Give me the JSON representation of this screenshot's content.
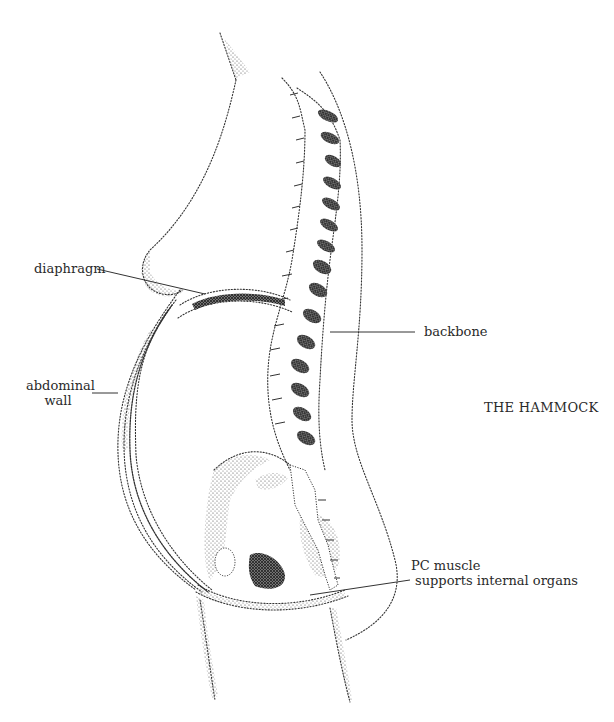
{
  "figure": {
    "title": "THE HAMMOCK",
    "colors": {
      "ink": "#2a2a2a",
      "background": "#ffffff"
    }
  },
  "labels": {
    "diaphragm": "diaphragm",
    "abdominal_wall_line1": "abdominal",
    "abdominal_wall_line2": "wall",
    "backbone": "backbone",
    "pc_muscle_line1": "PC muscle",
    "pc_muscle_line2": "supports internal organs"
  }
}
